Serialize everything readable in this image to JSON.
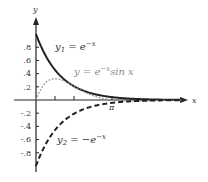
{
  "chart_data": {
    "type": "line",
    "title": "",
    "xlabel": "x",
    "ylabel": "y",
    "xlim": [
      -0.9,
      6.2
    ],
    "ylim": [
      -1.1,
      1.4
    ],
    "grid": false,
    "legend": "inline curve labels",
    "x_ticks": [
      0.785,
      1.571,
      3.1416
    ],
    "x_tick_labels": [
      "",
      "",
      "π"
    ],
    "y_ticks": [
      -0.8,
      -0.6,
      -0.4,
      -0.2,
      0.2,
      0.4,
      0.6,
      0.8
    ],
    "y_tick_labels": [
      "-.8",
      "-.6",
      "-.4",
      "-.2",
      ".2",
      ".4",
      ".6",
      ".8"
    ],
    "series": [
      {
        "name": "y1 = e^-x",
        "style": "solid",
        "color": "#222222",
        "x": [
          0,
          0.5,
          1,
          1.5,
          2,
          2.5,
          3,
          3.5,
          4,
          4.5,
          5,
          5.5,
          6
        ],
        "values": [
          1,
          0.607,
          0.368,
          0.223,
          0.135,
          0.082,
          0.05,
          0.03,
          0.018,
          0.011,
          0.007,
          0.004,
          0.002
        ]
      },
      {
        "name": "y = e^-x sin x",
        "style": "dotted",
        "color": "#8a8a8a",
        "x": [
          0,
          0.25,
          0.5,
          0.785,
          1,
          1.5,
          2,
          2.5,
          3,
          3.1416,
          3.5,
          4,
          5,
          6
        ],
        "values": [
          0,
          0.193,
          0.291,
          0.322,
          0.31,
          0.223,
          0.123,
          0.049,
          0.007,
          0,
          -0.011,
          -0.014,
          -0.006,
          -0.001
        ]
      },
      {
        "name": "y2 = -e^-x",
        "style": "dashed",
        "color": "#222222",
        "x": [
          0,
          0.5,
          1,
          1.5,
          2,
          2.5,
          3,
          3.5,
          4,
          4.5,
          5,
          5.5,
          6
        ],
        "values": [
          -1,
          -0.607,
          -0.368,
          -0.223,
          -0.135,
          -0.082,
          -0.05,
          -0.03,
          -0.018,
          -0.011,
          -0.007,
          -0.004,
          -0.002
        ]
      }
    ],
    "annotations": [
      "y1 = e^-x",
      "y = e^-x sin x",
      "y2 = -e^-x",
      "π"
    ]
  },
  "labels": {
    "x_axis": "x",
    "y_axis": "y",
    "pi": "π",
    "y1_base": "y",
    "y1_sub": "1",
    "y1_eq": " = e",
    "y1_exp": "−x",
    "y_base": "y = e",
    "y_exp": "−x",
    "y_tail": "sin x",
    "y2_base": "y",
    "y2_sub": "2",
    "y2_eq": " = −e",
    "y2_exp": "−x"
  },
  "ticks": {
    "y": [
      ".8",
      ".6",
      ".4",
      ".2",
      "-.2",
      "-.4",
      "-.6",
      "-.8"
    ]
  }
}
